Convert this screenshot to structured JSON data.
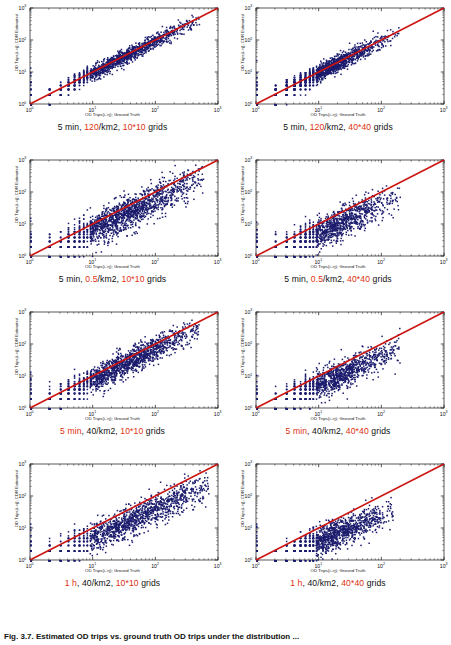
{
  "figure": {
    "caption": "Fig. 3.7. Estimated OD trips vs. ground truth OD trips under the distribution ...",
    "axis": {
      "xlabel": "OD Trips(i->j); Ground Truth",
      "ylabel": "OD Trips(i->j); CDR Estimated",
      "xticks": [
        "10⁰",
        "10¹",
        "10²",
        "10³"
      ],
      "yticks": [
        "10⁰",
        "10¹",
        "10²",
        "10³"
      ],
      "xlim": [
        1,
        1000
      ],
      "ylim": [
        1,
        1000
      ],
      "scale": "log-log",
      "grid": false
    },
    "colors": {
      "marker": "#1c1c6e",
      "refline": "#cc1512",
      "highlight": "#e03010",
      "axis": "#111111",
      "background": "#ffffff"
    },
    "reference_line": "y = x (identity)"
  },
  "panels": [
    {
      "id": "p1",
      "caption_parts": [
        {
          "text": "5 min, ",
          "hl": false
        },
        {
          "text": "120",
          "hl": true
        },
        {
          "text": "/km2, ",
          "hl": false
        },
        {
          "text": "10*10",
          "hl": true
        },
        {
          "text": " grids",
          "hl": false
        }
      ],
      "caption_plain": "5 min, 120/km2, 10*10 grids",
      "params": {
        "time_window": "5 min",
        "density": "120/km2",
        "grid": "10*10"
      }
    },
    {
      "id": "p2",
      "caption_parts": [
        {
          "text": "5 min, ",
          "hl": false
        },
        {
          "text": "120",
          "hl": true
        },
        {
          "text": "/km2, ",
          "hl": false
        },
        {
          "text": "40*40",
          "hl": true
        },
        {
          "text": " grids",
          "hl": false
        }
      ],
      "caption_plain": "5 min, 120/km2, 40*40 grids",
      "params": {
        "time_window": "5 min",
        "density": "120/km2",
        "grid": "40*40"
      }
    },
    {
      "id": "p3",
      "caption_parts": [
        {
          "text": "5 min, ",
          "hl": false
        },
        {
          "text": "0.5",
          "hl": true
        },
        {
          "text": "/km2, ",
          "hl": false
        },
        {
          "text": "10*10",
          "hl": true
        },
        {
          "text": " grids",
          "hl": false
        }
      ],
      "caption_plain": "5 min, 0.5/km2, 10*10 grids",
      "params": {
        "time_window": "5 min",
        "density": "0.5/km2",
        "grid": "10*10"
      }
    },
    {
      "id": "p4",
      "caption_parts": [
        {
          "text": "5 min, ",
          "hl": false
        },
        {
          "text": "0.5",
          "hl": true
        },
        {
          "text": "/km2, ",
          "hl": false
        },
        {
          "text": "40*40",
          "hl": true
        },
        {
          "text": " grids",
          "hl": false
        }
      ],
      "caption_plain": "5 min, 0.5/km2, 40*40 grids",
      "params": {
        "time_window": "5 min",
        "density": "0.5/km2",
        "grid": "40*40"
      }
    },
    {
      "id": "p5",
      "caption_parts": [
        {
          "text": "5 min",
          "hl": true
        },
        {
          "text": ", 40/km2, ",
          "hl": false
        },
        {
          "text": "10*10",
          "hl": true
        },
        {
          "text": " grids",
          "hl": false
        }
      ],
      "caption_plain": "5 min, 40/km2, 10*10 grids",
      "params": {
        "time_window": "5 min",
        "density": "40/km2",
        "grid": "10*10"
      }
    },
    {
      "id": "p6",
      "caption_parts": [
        {
          "text": "5 min",
          "hl": true
        },
        {
          "text": ", 40/km2, ",
          "hl": false
        },
        {
          "text": "40*40",
          "hl": true
        },
        {
          "text": " grids",
          "hl": false
        }
      ],
      "caption_plain": "5 min, 40/km2, 40*40 grids",
      "params": {
        "time_window": "5 min",
        "density": "40/km2",
        "grid": "40*40"
      }
    },
    {
      "id": "p7",
      "caption_parts": [
        {
          "text": "1 h",
          "hl": true
        },
        {
          "text": ", 40/km2, ",
          "hl": false
        },
        {
          "text": "10*10",
          "hl": true
        },
        {
          "text": " grids",
          "hl": false
        }
      ],
      "caption_plain": "1 h, 40/km2, 10*10 grids",
      "params": {
        "time_window": "1 h",
        "density": "40/km2",
        "grid": "10*10"
      }
    },
    {
      "id": "p8",
      "caption_parts": [
        {
          "text": "1 h",
          "hl": true
        },
        {
          "text": ", 40/km2, ",
          "hl": false
        },
        {
          "text": "40*40",
          "hl": true
        },
        {
          "text": " grids",
          "hl": false
        }
      ],
      "caption_plain": "1 h, 40/km2, 40*40 grids",
      "params": {
        "time_window": "1 h",
        "density": "40/km2",
        "grid": "40*40"
      }
    }
  ],
  "chart_data": {
    "type": "scatter",
    "xlabel": "OD Trips(i->j); Ground Truth",
    "ylabel": "OD Trips(i->j); CDR Estimated",
    "xscale": "log",
    "yscale": "log",
    "xlim": [
      1,
      1000
    ],
    "ylim": [
      1,
      1000
    ],
    "xticks": [
      1,
      10,
      100,
      1000
    ],
    "yticks": [
      1,
      10,
      100,
      1000
    ],
    "grid": false,
    "legend": "none",
    "annotations": [
      {
        "type": "line",
        "label": "y = x identity line",
        "color": "#cc1512",
        "from": [
          1,
          1
        ],
        "to": [
          1000,
          1000
        ]
      }
    ],
    "series": [
      {
        "name": "5 min, 120/km2, 10*10 grids",
        "panel": "p1",
        "n_points": 4200,
        "marker_color": "#1c1c6e",
        "x_range": [
          1,
          500
        ],
        "y_range": [
          1,
          500
        ],
        "cloud": {
          "x_center_log": 1.35,
          "y_center_log": 1.35,
          "spread_log": 0.62,
          "slope": 1.0,
          "bias_log": 0.0,
          "scatter_log": 0.12
        },
        "description": "Tight cloud hugging the identity line across the full range; small low-count quantization stripes near x<10"
      },
      {
        "name": "5 min, 120/km2, 40*40 grids",
        "panel": "p2",
        "n_points": 3600,
        "marker_color": "#1c1c6e",
        "x_range": [
          1,
          200
        ],
        "y_range": [
          1,
          200
        ],
        "cloud": {
          "x_center_log": 1.0,
          "y_center_log": 1.0,
          "spread_log": 0.5,
          "slope": 1.0,
          "bias_log": 0.0,
          "scatter_log": 0.13
        },
        "description": "Compact cloud along identity line, concentrated below x=100"
      },
      {
        "name": "5 min, 0.5/km2, 10*10 grids",
        "panel": "p3",
        "n_points": 5200,
        "marker_color": "#1c1c6e",
        "x_range": [
          1,
          600
        ],
        "y_range": [
          1,
          500
        ],
        "cloud": {
          "x_center_log": 1.45,
          "y_center_log": 1.3,
          "spread_log": 0.68,
          "slope": 0.95,
          "bias_log": -0.1,
          "scatter_log": 0.26
        },
        "description": "Broad fan-shaped cloud, systematically biased below the identity line"
      },
      {
        "name": "5 min, 0.5/km2, 40*40 grids",
        "panel": "p4",
        "n_points": 4000,
        "marker_color": "#1c1c6e",
        "x_range": [
          1,
          200
        ],
        "y_range": [
          1,
          150
        ],
        "cloud": {
          "x_center_log": 1.15,
          "y_center_log": 0.95,
          "spread_log": 0.55,
          "slope": 0.9,
          "bias_log": -0.16,
          "scatter_log": 0.24
        },
        "description": "Cloud falls increasingly below the identity line at larger trip counts"
      },
      {
        "name": "5 min, 40/km2, 10*10 grids",
        "panel": "p5",
        "n_points": 5000,
        "marker_color": "#1c1c6e",
        "x_range": [
          1,
          500
        ],
        "y_range": [
          1,
          400
        ],
        "cloud": {
          "x_center_log": 1.4,
          "y_center_log": 1.3,
          "spread_log": 0.65,
          "slope": 0.97,
          "bias_log": -0.06,
          "scatter_log": 0.2
        },
        "description": "Dense elongated cloud close to identity with mild underestimation"
      },
      {
        "name": "5 min, 40/km2, 40*40 grids",
        "panel": "p6",
        "n_points": 4100,
        "marker_color": "#1c1c6e",
        "x_range": [
          1,
          200
        ],
        "y_range": [
          1,
          120
        ],
        "cloud": {
          "x_center_log": 1.15,
          "y_center_log": 0.98,
          "spread_log": 0.55,
          "slope": 0.9,
          "bias_log": -0.15,
          "scatter_log": 0.22
        },
        "description": "Cloud sits clearly under the identity line"
      },
      {
        "name": "1 h, 40/km2, 10*10 grids",
        "panel": "p7",
        "n_points": 6000,
        "marker_color": "#1c1c6e",
        "x_range": [
          1,
          700
        ],
        "y_range": [
          1,
          400
        ],
        "cloud": {
          "x_center_log": 1.55,
          "y_center_log": 1.3,
          "spread_log": 0.72,
          "slope": 0.88,
          "bias_log": -0.14,
          "scatter_log": 0.24
        },
        "description": "Widest cloud, extends to x near 700 and sits below identity line"
      },
      {
        "name": "1 h, 40/km2, 40*40 grids",
        "panel": "p8",
        "n_points": 4300,
        "marker_color": "#1c1c6e",
        "x_range": [
          1,
          150
        ],
        "y_range": [
          1,
          80
        ],
        "cloud": {
          "x_center_log": 1.12,
          "y_center_log": 0.85,
          "spread_log": 0.52,
          "slope": 0.82,
          "bias_log": -0.22,
          "scatter_log": 0.22
        },
        "description": "Strong underestimation; cloud well below identity line with sparse high-value outliers"
      }
    ]
  }
}
